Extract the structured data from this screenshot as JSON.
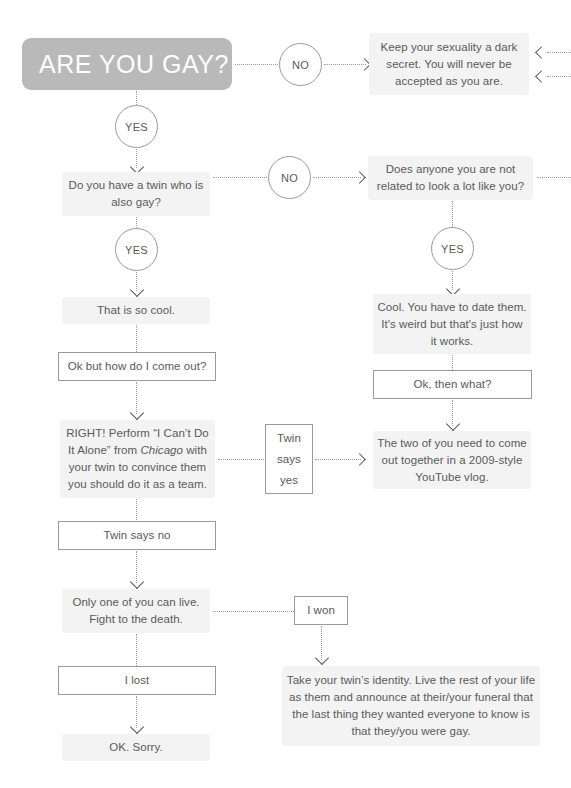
{
  "document": {
    "type": "flowchart",
    "title": "ARE YOU GAY?",
    "background_color": "#ffffff",
    "banner_color": "#b9b9b9",
    "soft_box_color": "#f3f3f3",
    "text_color": "#5a5a5a",
    "connector_color": "#9e9e9e"
  },
  "nodes": {
    "title_banner": "ARE YOU GAY?",
    "no_1": "NO",
    "keep_secret": "Keep your sexuality a dark secret. You will never be accepted as you are.",
    "yes_1": "YES",
    "twin_question": "Do you have a twin who is also gay?",
    "no_2": "NO",
    "does_anyone": "Does anyone you are not related to look a lot like you?",
    "yes_2": "YES",
    "yes_3": "YES",
    "so_cool": "That is so cool.",
    "cool_date_them": "Cool. You have to date them. It's weird but that's just how it works.",
    "how_come_out": "Ok but how do I come out?",
    "ok_then_what": "Ok, then what?",
    "right_perform_a": "RIGHT! Perform “I Can’t Do It Alone” from ",
    "right_perform_italic": "Chicago",
    "right_perform_b": " with your twin to convince them you should do it as a team.",
    "twin_says_yes": "Twin says yes",
    "two_of_you": "The two of you need to come out together in a 2009-style YouTube vlog.",
    "twin_says_no": "Twin says no",
    "only_one_lives": "Only one of you can live. Fight to the death.",
    "i_won": "I won",
    "i_lost": "I lost",
    "take_identity": "Take your twin’s identity. Live the rest of your life as them and announce at their/your funeral that the last thing they wanted everyone to know is that they/you were gay.",
    "ok_sorry": "OK. Sorry."
  }
}
